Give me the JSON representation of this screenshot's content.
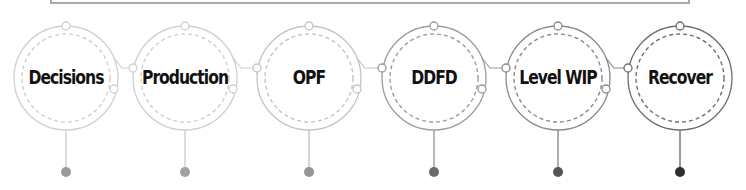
{
  "steps": [
    {
      "label": "Decisions",
      "cx": 66,
      "color": "#cfcfcf",
      "dot": "#9a9a9a"
    },
    {
      "label": "Production",
      "cx": 185,
      "color": "#cfcfcf",
      "dot": "#a2a2a2"
    },
    {
      "label": "OPF",
      "cx": 309,
      "color": "#c4c4c4",
      "dot": "#959595"
    },
    {
      "label": "DDFD",
      "cx": 434,
      "color": "#9c9c9c",
      "dot": "#6a6a6a"
    },
    {
      "label": "Level WIP",
      "cx": 558,
      "color": "#8a8a8a",
      "dot": "#555555"
    },
    {
      "label": "Recover",
      "cx": 680,
      "color": "#6e6e6e",
      "dot": "#2e2e2e"
    }
  ]
}
